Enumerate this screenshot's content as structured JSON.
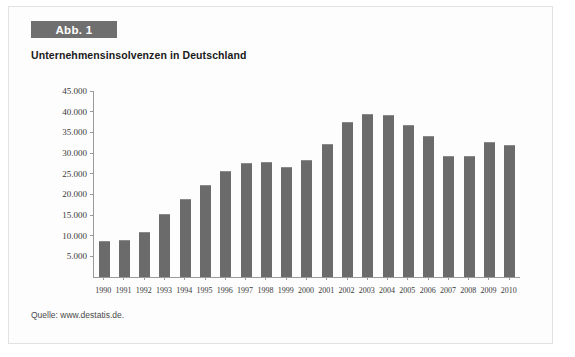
{
  "figure": {
    "label": "Abb. 1",
    "title": "Unternehmensinsolvenzen in Deutschland",
    "source": "Quelle: www.destatis.de.",
    "label_bg": "#6f6f6f",
    "bar_color": "#6b6b6b",
    "axis_color": "#9a9a9a",
    "frame_border": "#e2e2e2"
  },
  "chart_data": {
    "type": "bar",
    "title": "Unternehmensinsolvenzen in Deutschland",
    "xlabel": "",
    "ylabel": "",
    "ylim": [
      0,
      45000
    ],
    "grid": false,
    "legend": null,
    "ytick_labels": [
      "45.000",
      "40.000",
      "35.000",
      "30.000",
      "25.000",
      "20.000",
      "15.000",
      "10.000",
      "5.000"
    ],
    "ytick_values": [
      45000,
      40000,
      35000,
      30000,
      25000,
      20000,
      15000,
      10000,
      5000
    ],
    "categories": [
      "1990",
      "1991",
      "1992",
      "1993",
      "1994",
      "1995",
      "1996",
      "1997",
      "1998",
      "1999",
      "2000",
      "2001",
      "2002",
      "2003",
      "2004",
      "2005",
      "2006",
      "2007",
      "2008",
      "2009",
      "2010"
    ],
    "values": [
      8730,
      8840,
      10920,
      15150,
      18820,
      22344,
      25530,
      27474,
      27828,
      26620,
      28235,
      32278,
      37579,
      39320,
      39213,
      36843,
      34137,
      29160,
      29291,
      32687,
      31998
    ]
  }
}
